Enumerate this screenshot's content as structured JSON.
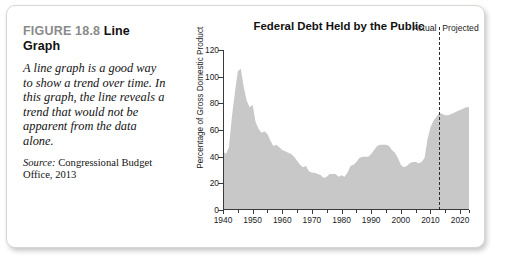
{
  "figure": {
    "number_label": "FIGURE 18.8",
    "title": "Line Graph",
    "caption": "A line graph is a good way to show a trend over time. In this graph, the line reveals a trend that would not be apparent from the data alone.",
    "source_label": "Source:",
    "source_text": "Congressional Budget Office, 2013"
  },
  "annotations": {
    "actual": "Actual",
    "projected": "Projected",
    "divider_year": 2013
  },
  "colors": {
    "fill": "#c8c8c8",
    "axis": "#3a3a3a",
    "fignum": "#8a8a8a",
    "panel_border": "#d8d6d2"
  },
  "chart_data": {
    "type": "area",
    "title": "Federal Debt Held by the Public",
    "xlabel": "",
    "ylabel": "Percentage of Gross Domestic Product",
    "xlim": [
      1940,
      2023
    ],
    "ylim": [
      0,
      120
    ],
    "ytick_step": 20,
    "yticks": [
      0,
      20,
      40,
      60,
      80,
      100,
      120
    ],
    "xticks": [
      1940,
      1950,
      1960,
      1970,
      1980,
      1990,
      2000,
      2010,
      2020
    ],
    "xticks_minor_step": 5,
    "grid": false,
    "legend": "none",
    "series": [
      {
        "name": "Federal Debt Held by the Public (% of GDP)",
        "x": [
          1940,
          1941,
          1942,
          1943,
          1944,
          1945,
          1946,
          1947,
          1948,
          1949,
          1950,
          1951,
          1952,
          1953,
          1954,
          1955,
          1956,
          1957,
          1958,
          1959,
          1960,
          1961,
          1962,
          1963,
          1964,
          1965,
          1966,
          1967,
          1968,
          1969,
          1970,
          1971,
          1972,
          1973,
          1974,
          1975,
          1976,
          1977,
          1978,
          1979,
          1980,
          1981,
          1982,
          1983,
          1984,
          1985,
          1986,
          1987,
          1988,
          1989,
          1990,
          1991,
          1992,
          1993,
          1994,
          1995,
          1996,
          1997,
          1998,
          1999,
          2000,
          2001,
          2002,
          2003,
          2004,
          2005,
          2006,
          2007,
          2008,
          2009,
          2010,
          2011,
          2012,
          2013,
          2014,
          2015,
          2016,
          2017,
          2018,
          2019,
          2020,
          2021,
          2022,
          2023
        ],
        "values": [
          44,
          42,
          47,
          70,
          88,
          104,
          106,
          92,
          82,
          77,
          79,
          66,
          61,
          58,
          59,
          57,
          52,
          48,
          49,
          47,
          45,
          44,
          43,
          42,
          40,
          37,
          34,
          32,
          33,
          29,
          28,
          28,
          27,
          26,
          24,
          25,
          27,
          27,
          27,
          25,
          26,
          25,
          28,
          33,
          34,
          36,
          39,
          40,
          40,
          40,
          42,
          45,
          48,
          49,
          49,
          49,
          48,
          45,
          43,
          39,
          34,
          32,
          33,
          35,
          36,
          36,
          35,
          36,
          39,
          53,
          62,
          67,
          70,
          73,
          72,
          71,
          71,
          72,
          73,
          74,
          75,
          76,
          77,
          77
        ]
      }
    ],
    "annotations": [
      {
        "type": "vline",
        "x": 2013,
        "style": "dashed",
        "left_label": "Actual",
        "right_label": "Projected"
      }
    ]
  }
}
